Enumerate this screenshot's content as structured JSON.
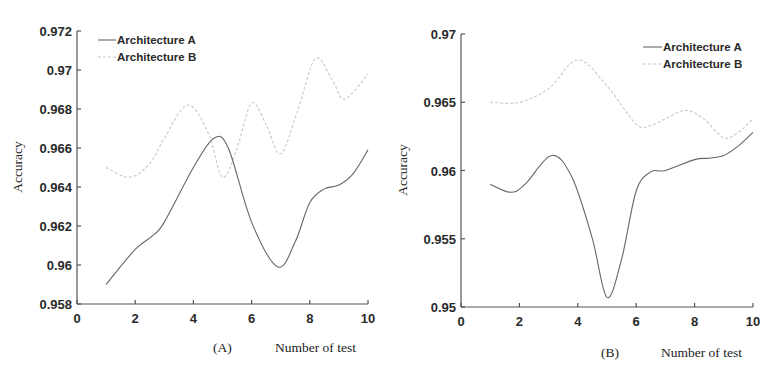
{
  "chart_data": [
    {
      "id": "A",
      "type": "line",
      "panel_label": "(A)",
      "title": "",
      "xlabel": "Number of test",
      "ylabel": "Accuracy",
      "xlim": [
        0,
        10
      ],
      "ylim": [
        0.958,
        0.972
      ],
      "xticks": [
        0,
        2,
        4,
        6,
        8,
        10
      ],
      "yticks": [
        0.958,
        0.96,
        0.962,
        0.964,
        0.966,
        0.968,
        0.97,
        0.972
      ],
      "ytick_labels": [
        "0.958",
        "0.96",
        "0.962",
        "0.964",
        "0.966",
        "0.968",
        "0.97",
        "0.972"
      ],
      "grid": false,
      "legend_position": "upper left",
      "series": [
        {
          "name": "Architecture A",
          "style": "solid",
          "color": "#666666",
          "x": [
            1,
            2,
            2.6,
            3,
            4,
            4.7,
            5.2,
            6,
            6.9,
            7.5,
            8,
            8.5,
            9,
            9.5,
            10
          ],
          "values": [
            0.959,
            0.9608,
            0.9615,
            0.9622,
            0.965,
            0.9665,
            0.966,
            0.9622,
            0.9599,
            0.9612,
            0.9632,
            0.9639,
            0.9641,
            0.9647,
            0.9659
          ]
        },
        {
          "name": "Architecture B",
          "style": "dashed",
          "color": "#c8c8c8",
          "x": [
            1,
            1.8,
            2.5,
            3,
            3.8,
            4.5,
            5,
            5.5,
            6,
            6.5,
            7,
            7.6,
            8.2,
            8.8,
            9.2,
            10
          ],
          "values": [
            0.965,
            0.9645,
            0.9652,
            0.9665,
            0.9682,
            0.9668,
            0.9645,
            0.966,
            0.9683,
            0.9672,
            0.9657,
            0.968,
            0.9706,
            0.9694,
            0.9685,
            0.9698
          ]
        }
      ]
    },
    {
      "id": "B",
      "type": "line",
      "panel_label": "(B)",
      "title": "",
      "xlabel": "Number of test",
      "ylabel": "Accuracy",
      "xlim": [
        0,
        10
      ],
      "ylim": [
        0.95,
        0.97
      ],
      "xticks": [
        0,
        2,
        4,
        6,
        8,
        10
      ],
      "yticks": [
        0.95,
        0.955,
        0.96,
        0.965,
        0.97
      ],
      "ytick_labels": [
        "0.95",
        "0.955",
        "0.96",
        "0.965",
        "0.97"
      ],
      "grid": false,
      "legend_position": "upper right",
      "series": [
        {
          "name": "Architecture A",
          "style": "solid",
          "color": "#666666",
          "x": [
            1,
            1.7,
            2.2,
            3.1,
            3.8,
            4.5,
            5,
            5.5,
            6,
            6.5,
            7,
            8,
            8.5,
            9,
            9.5,
            10
          ],
          "values": [
            0.959,
            0.9584,
            0.959,
            0.9611,
            0.9595,
            0.955,
            0.9507,
            0.9535,
            0.9585,
            0.9599,
            0.96,
            0.9608,
            0.9609,
            0.9611,
            0.9618,
            0.9628
          ]
        },
        {
          "name": "Architecture B",
          "style": "dashed",
          "color": "#c8c8c8",
          "x": [
            1,
            2,
            3,
            4,
            5,
            6,
            6.5,
            7,
            7.7,
            8.3,
            9,
            9.5,
            10
          ],
          "values": [
            0.965,
            0.965,
            0.966,
            0.9681,
            0.9662,
            0.9634,
            0.9633,
            0.9638,
            0.9644,
            0.9638,
            0.9624,
            0.9628,
            0.9638
          ]
        }
      ]
    }
  ]
}
